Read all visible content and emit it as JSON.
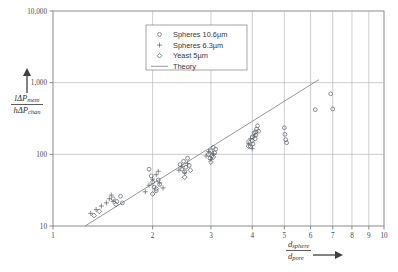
{
  "chart_data": {
    "type": "scatter",
    "title": "",
    "xlabel": "d_sphere / d_pore",
    "ylabel": "l ΔP_mem / h ΔP_chan",
    "xscale": "log",
    "yscale": "log",
    "xlim": [
      1,
      10
    ],
    "ylim": [
      10,
      10000
    ],
    "grid": true,
    "xticks": [
      1,
      2,
      3,
      4,
      5,
      6,
      7,
      8,
      9,
      10
    ],
    "xticklabels": [
      "1",
      "2",
      "3",
      "4",
      "5",
      "6",
      "7",
      "8",
      "9",
      "10"
    ],
    "yticks": [
      10,
      100,
      1000,
      10000
    ],
    "yticklabels": [
      "10",
      "100",
      "1,000",
      "10,000"
    ],
    "legend_position": "top-center-right",
    "series": [
      {
        "name": "Spheres 10.6µm",
        "marker": "circle",
        "points": [
          [
            1.52,
            24
          ],
          [
            1.56,
            22
          ],
          [
            1.6,
            26
          ],
          [
            1.62,
            21
          ],
          [
            1.95,
            62
          ],
          [
            1.98,
            50
          ],
          [
            2.0,
            41
          ],
          [
            2.02,
            35
          ],
          [
            2.05,
            31
          ],
          [
            2.08,
            44
          ],
          [
            2.1,
            38
          ],
          [
            2.42,
            72
          ],
          [
            2.45,
            62
          ],
          [
            2.48,
            80
          ],
          [
            2.5,
            57
          ],
          [
            2.52,
            66
          ],
          [
            2.55,
            88
          ],
          [
            2.58,
            70
          ],
          [
            2.95,
            100
          ],
          [
            2.98,
            88
          ],
          [
            3.0,
            112
          ],
          [
            3.02,
            95
          ],
          [
            3.05,
            125
          ],
          [
            3.08,
            105
          ],
          [
            3.1,
            118
          ],
          [
            3.9,
            150
          ],
          [
            3.95,
            128
          ],
          [
            4.0,
            175
          ],
          [
            4.02,
            140
          ],
          [
            4.05,
            200
          ],
          [
            4.08,
            165
          ],
          [
            4.1,
            185
          ],
          [
            4.12,
            225
          ],
          [
            4.15,
            250
          ],
          [
            4.18,
            210
          ],
          [
            5.0,
            235
          ],
          [
            5.02,
            190
          ],
          [
            5.05,
            160
          ],
          [
            5.08,
            145
          ],
          [
            6.2,
            420
          ],
          [
            6.9,
            700
          ],
          [
            7.0,
            430
          ]
        ]
      },
      {
        "name": "Spheres 6.3µm",
        "marker": "plus",
        "points": [
          [
            1.3,
            15
          ],
          [
            1.35,
            17
          ],
          [
            1.4,
            19
          ],
          [
            1.45,
            21
          ],
          [
            1.48,
            24
          ],
          [
            1.5,
            27
          ],
          [
            1.52,
            22
          ],
          [
            1.9,
            30
          ],
          [
            1.95,
            37
          ],
          [
            2.0,
            45
          ],
          [
            2.05,
            52
          ],
          [
            2.08,
            58
          ],
          [
            2.1,
            40
          ],
          [
            2.15,
            34
          ],
          [
            2.4,
            60
          ],
          [
            2.45,
            68
          ],
          [
            2.5,
            55
          ],
          [
            2.55,
            74
          ],
          [
            2.9,
            95
          ],
          [
            2.95,
            110
          ],
          [
            3.0,
            85
          ],
          [
            3.05,
            102
          ],
          [
            3.9,
            140
          ],
          [
            3.95,
            165
          ],
          [
            4.0,
            120
          ],
          [
            4.05,
            180
          ]
        ]
      },
      {
        "name": "Yeast 5µm",
        "marker": "diamond",
        "points": [
          [
            1.33,
            14
          ],
          [
            1.38,
            16
          ],
          [
            1.55,
            20
          ],
          [
            2.0,
            28
          ],
          [
            2.05,
            33
          ],
          [
            2.5,
            48
          ],
          [
            2.6,
            60
          ],
          [
            3.0,
            78
          ],
          [
            3.05,
            92
          ],
          [
            3.9,
            130
          ],
          [
            4.0,
            155
          ],
          [
            4.1,
            205
          ]
        ]
      }
    ],
    "theory": {
      "name": "Theory",
      "type": "line",
      "points": [
        [
          1.25,
          10
        ],
        [
          6.35,
          1100
        ]
      ]
    }
  },
  "axes": {
    "y_label_numerator_main": "lΔP",
    "y_label_numerator_sub": "mem",
    "y_label_denominator_main": "hΔP",
    "y_label_denominator_sub": "chan",
    "x_label_numerator_main": "d",
    "x_label_numerator_sub": "sphere",
    "x_label_denominator_main": "d",
    "x_label_denominator_sub": "pore"
  },
  "legend": {
    "entries": [
      {
        "label": "Spheres 10.6µm",
        "marker": "circle"
      },
      {
        "label": "Spheres 6.3µm",
        "marker": "plus"
      },
      {
        "label": "Yeast 5µm",
        "marker": "diamond"
      },
      {
        "label": "Theory",
        "marker": "line"
      }
    ]
  },
  "colors": {
    "axis": "#6e7176",
    "grid": "#a9acb1",
    "marker": "#5c6066",
    "theory": "#7a7d82",
    "text": "#33363a",
    "background": "#ffffff"
  }
}
